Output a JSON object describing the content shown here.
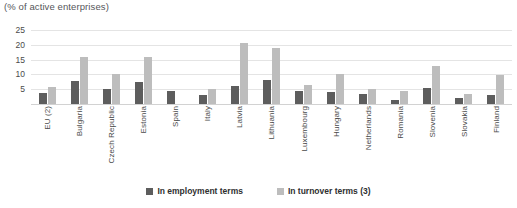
{
  "chart_data": {
    "type": "bar",
    "title": "(% of active enterprises)",
    "xlabel": "",
    "ylabel": "",
    "ylim": [
      0,
      25
    ],
    "yticks": [
      0,
      5,
      10,
      15,
      20,
      25
    ],
    "ytick_labels": [
      "",
      "5",
      "10",
      "15",
      "20",
      "25"
    ],
    "grid": true,
    "legend_position": "bottom",
    "categories": [
      "EU (2)",
      "Bulgaria",
      "Czech Republic",
      "Estonia",
      "Spain",
      "Italy",
      "Latvia",
      "Lithuania",
      "Luxembourg",
      "Hungary",
      "Netherlands",
      "Romania",
      "Slovenia",
      "Slovakia",
      "Finland"
    ],
    "series": [
      {
        "name": "In employment terms",
        "color": "#5d5d5d",
        "values": [
          3.8,
          7.7,
          5.1,
          7.3,
          4.3,
          3.2,
          6.0,
          8.0,
          4.3,
          4.0,
          3.5,
          1.3,
          5.5,
          2.2,
          3.0
        ]
      },
      {
        "name": "In turnover terms (3)",
        "color": "#bdbdbd",
        "values": [
          5.7,
          15.8,
          10.1,
          15.8,
          0,
          5.2,
          20.5,
          19.0,
          6.5,
          10.3,
          5.2,
          4.5,
          13.0,
          3.3,
          9.8
        ]
      }
    ]
  },
  "legend": {
    "items": [
      {
        "label": "In employment terms"
      },
      {
        "label": "In turnover terms (3)"
      }
    ]
  }
}
